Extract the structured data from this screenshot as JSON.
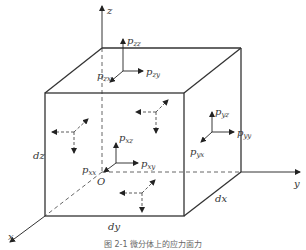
{
  "figure": {
    "caption": "图 2-1  微分体上的应力面力",
    "axes": {
      "x": "x",
      "y": "y",
      "z": "z",
      "origin": "O"
    },
    "dimensions": {
      "dx": "dx",
      "dy": "dy",
      "dz": "dz"
    },
    "top_face": {
      "normal": {
        "p": "p",
        "s": "zz"
      },
      "shear_x": {
        "p": "p",
        "s": "zx"
      },
      "shear_y": {
        "p": "p",
        "s": "zy"
      }
    },
    "front_face": {
      "normal": {
        "p": "p",
        "s": "xx"
      },
      "shear_y": {
        "p": "p",
        "s": "xy"
      },
      "shear_z": {
        "p": "p",
        "s": "xz"
      }
    },
    "right_face": {
      "normal": {
        "p": "p",
        "s": "yy"
      },
      "shear_x": {
        "p": "p",
        "s": "yx"
      },
      "shear_z": {
        "p": "p",
        "s": "yz"
      }
    },
    "colors": {
      "line": "#333333",
      "dashed": "#555555",
      "background": "#ffffff"
    }
  }
}
